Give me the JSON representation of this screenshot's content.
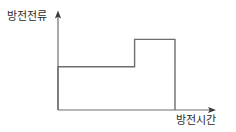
{
  "figure": {
    "name": "discharge-current-vs-discharge-time-step-graph",
    "background_color": "#ffffff",
    "line_color": "#6e6e6e",
    "text_color": "#2b2b2b",
    "axis_color": "#6e6e6e"
  },
  "axes": {
    "y": {
      "label": "방전전류",
      "arrow": "up-arrow-icon",
      "origin_px": [
        58,
        110
      ],
      "tip_px": [
        58,
        12
      ]
    },
    "x": {
      "label": "방전시간",
      "arrow": "right-arrow-icon",
      "origin_px": [
        58,
        110
      ],
      "tip_px": [
        215,
        110
      ]
    }
  },
  "chart_data": {
    "type": "line",
    "title": "",
    "subtitle": "",
    "xlabel": "방전시간",
    "ylabel": "방전전류",
    "xlim": [
      0,
      1
    ],
    "ylim": [
      0,
      1
    ],
    "grid": false,
    "legend": null,
    "tick_labels": {
      "x": [],
      "y": []
    },
    "annotations": [],
    "series": [
      {
        "name": "방전전류",
        "style": "step",
        "x": [
          0,
          0,
          0.655,
          0.655,
          1.0,
          1.0
        ],
        "y": [
          0,
          0.52,
          0.52,
          0.85,
          0.85,
          0
        ]
      }
    ],
    "steps": [
      {
        "name": "low-plateau",
        "x_start": 0,
        "x_end": 0.655,
        "level": 0.52
      },
      {
        "name": "high-plateau",
        "x_start": 0.655,
        "x_end": 1.0,
        "level": 0.85
      }
    ]
  }
}
